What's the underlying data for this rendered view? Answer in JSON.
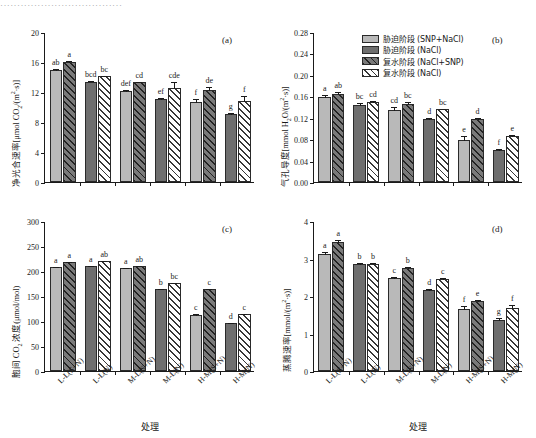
{
  "caption_strip": "····································",
  "legend": {
    "items": [
      {
        "label": "胁迫阶段 (SNP+NaCl)",
        "swatch": "light-solid"
      },
      {
        "label": "胁迫阶段 (NaCl)",
        "swatch": "dark-solid"
      },
      {
        "label": "复水阶段 (NaCl+SNP)",
        "swatch": "dark-hatch"
      },
      {
        "label": "复水阶段 (NaCl)",
        "swatch": "white-hatch"
      }
    ]
  },
  "xlabel": "处理",
  "categories": [
    "L-L(S+N)",
    "L-L(N)",
    "M-L(S+N)",
    "M-L(N)",
    "H-M(S+N)",
    "H-M(N)"
  ],
  "chart_data": [
    {
      "type": "bar",
      "panel": "(a)",
      "title": "",
      "ylabel": "净光合速率[μmol CO2/(m2·s)]",
      "xlabel": "处理",
      "ylim": [
        0,
        20
      ],
      "yticks": [
        0,
        4,
        8,
        12,
        16,
        20
      ],
      "categories": [
        "L-L(S+N)",
        "L-L(N)",
        "M-L(S+N)",
        "M-L(N)",
        "H-M(S+N)",
        "H-M(N)"
      ],
      "series": [
        {
          "name": "stress",
          "values": [
            14.9,
            13.4,
            12.1,
            11.1,
            10.7,
            9.1
          ],
          "errors": [
            0.35,
            0.22,
            0.28,
            0.25,
            0.55,
            0.2
          ]
        },
        {
          "name": "rewater",
          "values": [
            16.0,
            14.1,
            13.3,
            12.6,
            12.3,
            10.8
          ],
          "errors": [
            0.25,
            0.2,
            0.22,
            0.9,
            0.45,
            0.85
          ]
        }
      ],
      "sig_letters": [
        [
          "ab",
          "bcd",
          "def",
          "ef",
          "f",
          "g"
        ],
        [
          "a",
          "bc",
          "cd",
          "cde",
          "de",
          "f"
        ]
      ]
    },
    {
      "type": "bar",
      "panel": "(b)",
      "title": "",
      "ylabel": "气孔导度[mmol H2O/(m2·s)]",
      "xlabel": "处理",
      "ylim": [
        0,
        0.28
      ],
      "yticks": [
        0.0,
        0.04,
        0.08,
        0.12,
        0.16,
        0.2,
        0.24,
        0.28
      ],
      "categories": [
        "L-L(S+N)",
        "L-L(N)",
        "M-L(S+N)",
        "M-L(N)",
        "H-M(S+N)",
        "H-M(N)"
      ],
      "series": [
        {
          "name": "stress",
          "values": [
            0.158,
            0.143,
            0.135,
            0.117,
            0.079,
            0.059
          ],
          "errors": [
            0.006,
            0.006,
            0.006,
            0.005,
            0.008,
            0.004
          ]
        },
        {
          "name": "rewater",
          "values": [
            0.165,
            0.149,
            0.146,
            0.137,
            0.117,
            0.085
          ],
          "errors": [
            0.005,
            0.005,
            0.005,
            0.001,
            0.004,
            0.004
          ]
        }
      ],
      "sig_letters": [
        [
          "a",
          "bc",
          "cd",
          "d",
          "e",
          "f"
        ],
        [
          "ab",
          "cd",
          "bc",
          "bc",
          "d",
          "e"
        ]
      ]
    },
    {
      "type": "bar",
      "panel": "(c)",
      "title": "",
      "ylabel": "胞间 CO2 浓度(μmol/mol)",
      "xlabel": "处理",
      "ylim": [
        0,
        300
      ],
      "yticks": [
        0,
        50,
        100,
        150,
        200,
        250,
        300
      ],
      "categories": [
        "L-L(S+N)",
        "L-L(N)",
        "M-L(S+N)",
        "M-L(N)",
        "H-M(S+N)",
        "H-M(N)"
      ],
      "series": [
        {
          "name": "stress",
          "values": [
            209,
            211,
            206,
            165,
            113,
            96
          ],
          "errors": [
            2,
            2,
            1.5,
            2,
            3,
            2.5
          ]
        },
        {
          "name": "rewater",
          "values": [
            218,
            220,
            210,
            176,
            164,
            115
          ],
          "errors": [
            2,
            1.5,
            2,
            2,
            3,
            2
          ]
        }
      ],
      "sig_letters": [
        [
          "a",
          "a",
          "a",
          "b",
          "c",
          "d"
        ],
        [
          "a",
          "ab",
          "ab",
          "bc",
          "c",
          "c"
        ]
      ]
    },
    {
      "type": "bar",
      "panel": "(d)",
      "title": "",
      "ylabel": "蒸腾速率[mmol/(m2·s)]",
      "xlabel": "处理",
      "ylim": [
        0,
        4
      ],
      "yticks": [
        0,
        1,
        2,
        3,
        4
      ],
      "categories": [
        "L-L(S+N)",
        "L-L(N)",
        "M-L(S+N)",
        "M-L(N)",
        "H-M(S+N)",
        "H-M(N)"
      ],
      "series": [
        {
          "name": "stress",
          "values": [
            3.13,
            2.85,
            2.47,
            2.15,
            1.65,
            1.36
          ],
          "errors": [
            0.07,
            0.05,
            0.07,
            0.07,
            0.1,
            0.07
          ]
        },
        {
          "name": "rewater",
          "values": [
            3.44,
            2.86,
            2.74,
            2.45,
            1.87,
            1.68
          ],
          "errors": [
            0.09,
            0.05,
            0.06,
            0.05,
            0.06,
            0.11
          ]
        }
      ],
      "sig_letters": [
        [
          "a",
          "b",
          "c",
          "d",
          "f",
          "g"
        ],
        [
          "a",
          "b",
          "b",
          "c",
          "e",
          "f"
        ]
      ]
    }
  ]
}
